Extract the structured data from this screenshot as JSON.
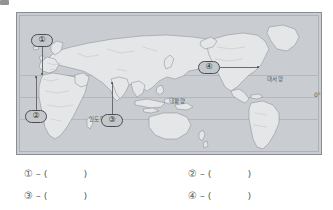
{
  "page": {
    "type": "worksheet-map-question",
    "background_color": "#ffffff"
  },
  "map": {
    "name": "world-map",
    "ocean_fill_color": "#c9cdd2",
    "land_fill_color": "#e4e6e8",
    "border_color": "#8a8d92",
    "labels": [
      {
        "id": "pacific",
        "text": "태평양",
        "x": 168,
        "y": 88
      },
      {
        "id": "atlantic",
        "text": "대서양",
        "x": 266,
        "y": 66
      },
      {
        "id": "indian",
        "text": "인도양",
        "x": 88,
        "y": 106
      }
    ],
    "equator_label": "0°",
    "markers": [
      {
        "id": "marker-1",
        "number": "①",
        "x": 30,
        "y": 27,
        "target_x": 41,
        "target_y": 58
      },
      {
        "id": "marker-2",
        "number": "②",
        "x": 24,
        "y": 110,
        "target_x": 35,
        "target_y": 74
      },
      {
        "id": "marker-3",
        "number": "③",
        "x": 100,
        "y": 114,
        "target_x": 111,
        "target_y": 83
      },
      {
        "id": "marker-4",
        "number": "④",
        "x": 196,
        "y": 60,
        "target_x": 237,
        "target_y": 67
      }
    ]
  },
  "answers": {
    "dash": "–",
    "open_paren": "(",
    "close_paren": ")",
    "rows": [
      [
        {
          "id": "answer-1",
          "number": "①",
          "value": ""
        },
        {
          "id": "answer-2",
          "number": "②",
          "value": ""
        }
      ],
      [
        {
          "id": "answer-3",
          "number": "③",
          "value": ""
        },
        {
          "id": "answer-4",
          "number": "④",
          "value": ""
        }
      ]
    ]
  }
}
